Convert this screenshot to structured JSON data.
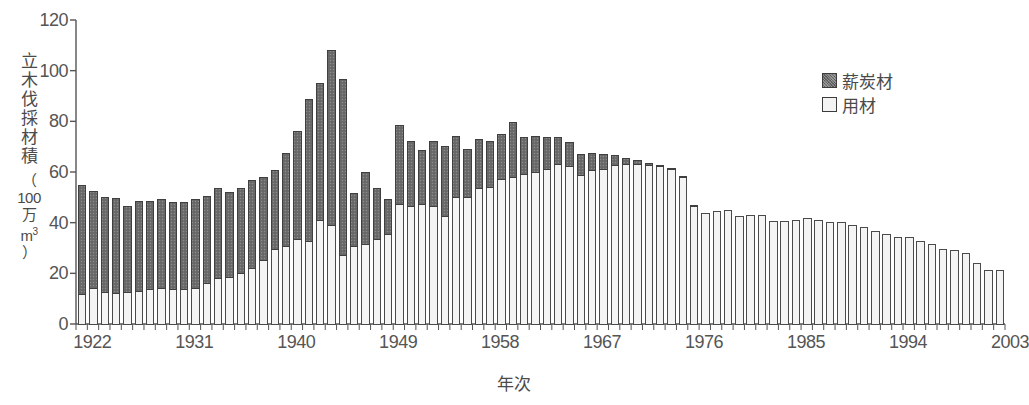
{
  "chart_data": {
    "type": "bar",
    "stacked": true,
    "title": "",
    "xlabel": "年次",
    "ylabel": "立木伐採材積（100万m³）",
    "ylabel_main": "立木伐採材積",
    "ylabel_unit_open": "（",
    "ylabel_unit_num": "100",
    "ylabel_unit_man": "万",
    "ylabel_unit_m": "m",
    "ylabel_unit_sup": "3",
    "ylabel_unit_close": "）",
    "ylim": [
      0,
      120
    ],
    "yticks": [
      0,
      20,
      40,
      60,
      80,
      100,
      120
    ],
    "ytick_labels": [
      "0",
      "20",
      "40",
      "60",
      "80",
      "100",
      "120"
    ],
    "grid": false,
    "legend_position": "top-right",
    "xtick_labels": [
      "1922",
      "1931",
      "1940",
      "1949",
      "1958",
      "1967",
      "1976",
      "1985",
      "1994",
      "2003"
    ],
    "xtick_years": [
      1922,
      1931,
      1940,
      1949,
      1958,
      1967,
      1976,
      1985,
      1994,
      2003
    ],
    "categories": [
      1922,
      1923,
      1924,
      1925,
      1926,
      1927,
      1928,
      1929,
      1930,
      1931,
      1932,
      1933,
      1934,
      1935,
      1936,
      1937,
      1938,
      1939,
      1940,
      1941,
      1942,
      1943,
      1944,
      1945,
      1946,
      1947,
      1948,
      1949,
      1950,
      1951,
      1952,
      1953,
      1954,
      1955,
      1956,
      1957,
      1958,
      1959,
      1960,
      1961,
      1962,
      1963,
      1964,
      1965,
      1966,
      1967,
      1968,
      1969,
      1970,
      1971,
      1972,
      1973,
      1974,
      1975,
      1976,
      1977,
      1978,
      1979,
      1980,
      1981,
      1982,
      1983,
      1984,
      1985,
      1986,
      1987,
      1988,
      1989,
      1990,
      1991,
      1992,
      1993,
      1994,
      1995,
      1996,
      1997,
      1998,
      1999,
      2000,
      2001,
      2002,
      2003
    ],
    "series": [
      {
        "name": "用材",
        "key": "yozai",
        "color": "#f4f4f4",
        "values": [
          11.5,
          14.0,
          12.5,
          12.0,
          12.5,
          13.0,
          13.5,
          14.0,
          13.5,
          13.5,
          14.0,
          16.0,
          18.0,
          18.5,
          20.0,
          22.0,
          25.0,
          29.5,
          30.5,
          33.5,
          32.5,
          41.0,
          39.0,
          27.0,
          30.5,
          31.5,
          33.5,
          35.5,
          47.0,
          46.5,
          47.0,
          46.5,
          42.5,
          50.0,
          50.0,
          53.5,
          54.0,
          57.0,
          58.0,
          59.0,
          60.0,
          61.0,
          63.0,
          62.0,
          58.5,
          60.5,
          61.0,
          62.5,
          63.0,
          63.0,
          62.5,
          62.0,
          61.0,
          58.0,
          46.5,
          43.5,
          44.5,
          45.0,
          42.5,
          43.0,
          43.0,
          40.5,
          40.5,
          41.0,
          41.5,
          41.0,
          40.0,
          40.0,
          39.0,
          38.0,
          36.5,
          35.5,
          34.0,
          34.0,
          32.5,
          31.5,
          29.5,
          29.0,
          28.0,
          24.0,
          21.0,
          21.0
        ]
      },
      {
        "name": "薪炭材",
        "key": "shintanzai",
        "color": "#6d6d6d",
        "values": [
          43.0,
          38.5,
          37.5,
          37.5,
          34.0,
          35.5,
          35.0,
          35.0,
          34.5,
          34.5,
          35.0,
          34.5,
          35.5,
          33.5,
          33.5,
          34.5,
          33.0,
          31.0,
          37.0,
          42.5,
          56.0,
          54.0,
          69.0,
          69.5,
          21.0,
          28.5,
          20.0,
          13.5,
          31.5,
          25.5,
          21.5,
          25.5,
          27.5,
          24.0,
          19.0,
          19.5,
          18.0,
          18.0,
          21.5,
          14.5,
          14.0,
          12.5,
          10.5,
          9.5,
          8.5,
          7.0,
          6.0,
          4.0,
          2.5,
          1.5,
          1.0,
          0.5,
          0.3,
          0.2,
          0.2,
          0.0,
          0.0,
          0.0,
          0.0,
          0.0,
          0.0,
          0.0,
          0.0,
          0.0,
          0.0,
          0.0,
          0.0,
          0.0,
          0.0,
          0.0,
          0.0,
          0.0,
          0.0,
          0.0,
          0.0,
          0.0,
          0.0,
          0.0,
          0.0,
          0.0,
          0.0,
          0.0
        ]
      }
    ],
    "totals": [
      54.5,
      52.5,
      50.0,
      49.5,
      46.5,
      48.5,
      48.5,
      49.0,
      48.0,
      48.0,
      49.0,
      50.5,
      53.5,
      52.0,
      53.5,
      56.5,
      58.0,
      60.5,
      67.5,
      76.0,
      88.5,
      95.0,
      108.0,
      96.5,
      51.5,
      60.0,
      53.5,
      49.0,
      78.5,
      72.0,
      68.5,
      72.0,
      70.0,
      74.0,
      69.0,
      73.0,
      72.0,
      75.0,
      79.5,
      73.5,
      74.0,
      73.5,
      73.5,
      71.5,
      67.0,
      67.5,
      67.0,
      66.5,
      65.5,
      64.5,
      63.5,
      62.5,
      61.3,
      58.2,
      46.7,
      43.5,
      44.5,
      45.0,
      42.5,
      43.0,
      43.0,
      40.5,
      40.5,
      41.0,
      41.5,
      41.0,
      40.0,
      40.0,
      39.0,
      38.0,
      36.5,
      35.5,
      34.0,
      34.0,
      32.5,
      31.5,
      29.5,
      29.0,
      28.0,
      24.0,
      21.0,
      21.0
    ]
  },
  "legend": {
    "items": [
      {
        "label": "薪炭材",
        "style": "dark"
      },
      {
        "label": "用材",
        "style": "light"
      }
    ]
  },
  "colors": {
    "dark_fill": "#6d6d6d",
    "light_fill": "#f4f4f4",
    "outline": "#4a4a4a",
    "axis": "#555555",
    "background": "#ffffff"
  }
}
